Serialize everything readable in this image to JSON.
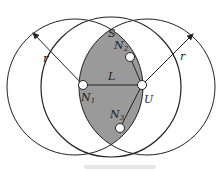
{
  "diagram": {
    "labels": {
      "region": "S",
      "radius_left": "r",
      "radius_right": "r",
      "link": "L",
      "node_n1": "N",
      "node_n1_sub": "1",
      "node_n2": "N",
      "node_n2_sub": "2",
      "node_n3": "N",
      "node_n3_sub": "3",
      "node_u": "U"
    },
    "colors": {
      "lens_fill": "#9a9a9a",
      "stroke": "#222222",
      "node_fill": "#ffffff"
    },
    "circles": [
      {
        "name": "left",
        "cx": 75,
        "cy": 87,
        "r": 68
      },
      {
        "name": "right",
        "cx": 147,
        "cy": 87,
        "r": 68
      }
    ],
    "nodes": [
      {
        "id": "N1",
        "x": 83,
        "y": 85
      },
      {
        "id": "U",
        "x": 142,
        "y": 85
      },
      {
        "id": "N2",
        "x": 130,
        "y": 57
      },
      {
        "id": "N3",
        "x": 120,
        "y": 128
      }
    ],
    "edges": [
      [
        "N1",
        "U"
      ],
      [
        "U",
        "N2"
      ],
      [
        "U",
        "N3"
      ]
    ]
  }
}
